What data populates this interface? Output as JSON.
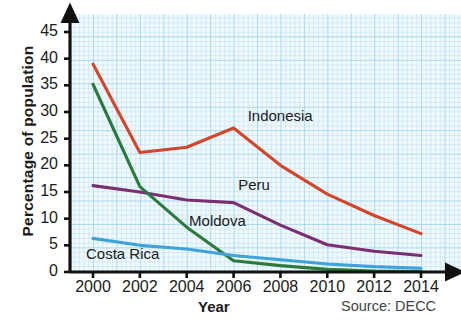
{
  "chart_data": {
    "type": "line",
    "title": "",
    "xlabel": "Year",
    "ylabel": "Percentage of population",
    "source": "Source: DECC",
    "x": [
      2000,
      2002,
      2004,
      2006,
      2008,
      2010,
      2012,
      2014
    ],
    "xtick_labels": [
      "2000",
      "2002",
      "2004",
      "2006",
      "2008",
      "2010",
      "2012",
      "2014"
    ],
    "ytick_labels": [
      "0",
      "5",
      "10",
      "15",
      "20",
      "25",
      "30",
      "35",
      "40",
      "45"
    ],
    "ytick_values": [
      0,
      5,
      10,
      15,
      20,
      25,
      30,
      35,
      40,
      45
    ],
    "xlim": [
      1999,
      2015
    ],
    "ylim": [
      0,
      47
    ],
    "grid": true,
    "legend_position": "inline-labels",
    "series": [
      {
        "name": "Indonesia",
        "color": "#d2472b",
        "values": [
          39.0,
          22.4,
          23.4,
          27.0,
          20.0,
          14.6,
          10.6,
          7.2
        ],
        "label_x": 2006.6,
        "label_y": 29.0
      },
      {
        "name": "Peru",
        "color": "#7b2f72",
        "values": [
          16.2,
          15.0,
          13.5,
          13.0,
          8.8,
          5.1,
          3.9,
          3.1
        ],
        "label_x": 2006.2,
        "label_y": 16.2
      },
      {
        "name": "Moldova",
        "color": "#2b7a3c",
        "values": [
          35.2,
          16.0,
          8.4,
          2.1,
          1.2,
          0.5,
          0.2,
          0.1
        ],
        "label_x": 2004.1,
        "label_y": 9.4
      },
      {
        "name": "Costa Rica",
        "color": "#3da3d8",
        "values": [
          6.3,
          5.0,
          4.3,
          3.1,
          2.3,
          1.5,
          1.0,
          0.7
        ],
        "label_x": 1999.7,
        "label_y": 3.1
      }
    ]
  }
}
